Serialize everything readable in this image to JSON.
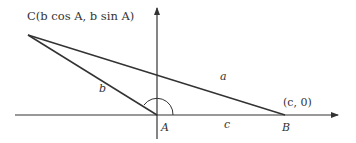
{
  "diagram": {
    "points": {
      "C": {
        "label": "C(b cos A, b sin A)",
        "x": 28,
        "y": 35
      },
      "A": {
        "label": "A",
        "x": 157,
        "y": 115
      },
      "B": {
        "label": "B",
        "coord_label": "(c, 0)",
        "x": 285,
        "y": 115
      }
    },
    "sides": {
      "a": "a",
      "b": "b",
      "c": "c"
    },
    "stroke_color": "#333333"
  }
}
